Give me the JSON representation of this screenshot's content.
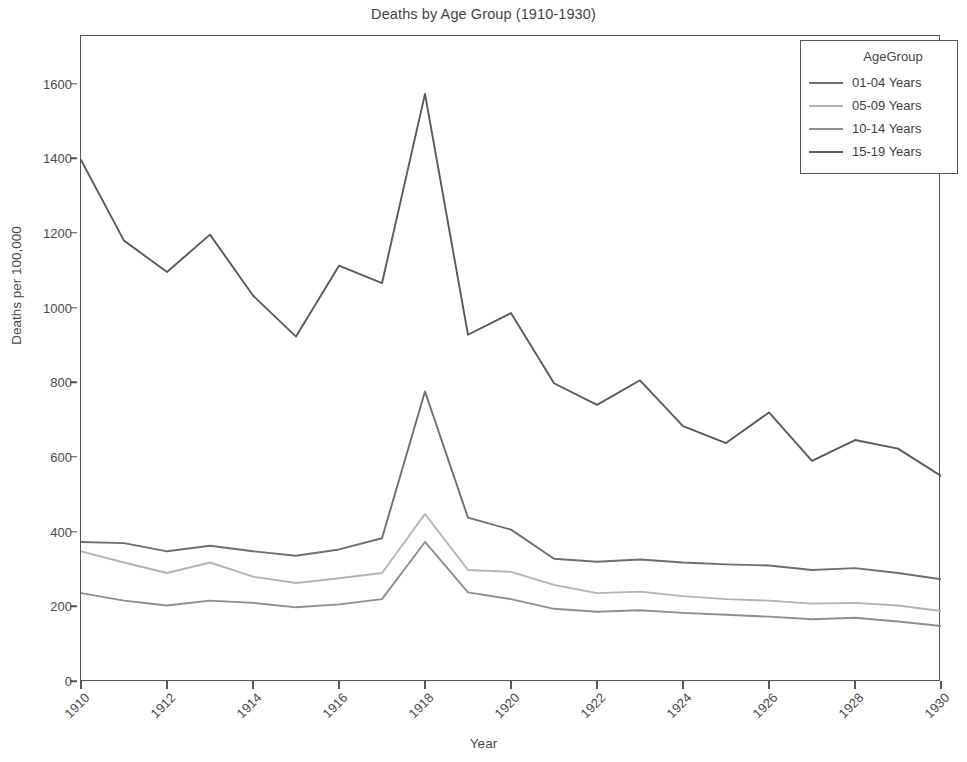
{
  "chart_data": {
    "type": "line",
    "title": "Deaths by Age Group (1910-1930)",
    "xlabel": "Year",
    "ylabel": "Deaths per 100,000",
    "x": [
      1910,
      1911,
      1912,
      1913,
      1914,
      1915,
      1916,
      1917,
      1918,
      1919,
      1920,
      1921,
      1922,
      1923,
      1924,
      1925,
      1926,
      1927,
      1928,
      1929,
      1930
    ],
    "xticks": [
      1910,
      1912,
      1914,
      1916,
      1918,
      1920,
      1922,
      1924,
      1926,
      1928,
      1930
    ],
    "xtick_labels": [
      "1910",
      "1912",
      "1914",
      "1916",
      "1918",
      "1920",
      "1922",
      "1924",
      "1926",
      "1928",
      "1930"
    ],
    "yticks": [
      0,
      200,
      400,
      600,
      800,
      1000,
      1200,
      1400,
      1600
    ],
    "ytick_labels": [
      "0",
      "200",
      "400",
      "600",
      "800",
      "1000",
      "1200",
      "1400",
      "1600"
    ],
    "xlim": [
      1910,
      1930
    ],
    "ylim": [
      0,
      1730
    ],
    "grid": false,
    "legend_title": "AgeGroup",
    "legend_position": "top-right",
    "series": [
      {
        "name": "01-04 Years",
        "color": "#6f6f6f",
        "values": [
          375,
          372,
          350,
          365,
          350,
          338,
          355,
          385,
          778,
          440,
          408,
          330,
          322,
          328,
          320,
          315,
          312,
          300,
          305,
          292,
          275
        ]
      },
      {
        "name": "05-09 Years",
        "color": "#b4b4b4",
        "values": [
          350,
          320,
          292,
          320,
          282,
          265,
          278,
          292,
          450,
          300,
          295,
          260,
          238,
          242,
          230,
          222,
          218,
          210,
          212,
          205,
          190
        ]
      },
      {
        "name": "10-14 Years",
        "color": "#8e8e8e",
        "values": [
          238,
          218,
          205,
          218,
          212,
          200,
          208,
          222,
          375,
          240,
          222,
          196,
          188,
          192,
          185,
          180,
          175,
          168,
          172,
          162,
          150
        ]
      },
      {
        "name": "15-19 Years",
        "color": "#5a5a5a",
        "values": [
          1398,
          1182,
          1098,
          1198,
          1035,
          925,
          1115,
          1068,
          1575,
          930,
          988,
          800,
          742,
          808,
          685,
          640,
          722,
          592,
          648,
          625,
          552
        ]
      }
    ]
  }
}
